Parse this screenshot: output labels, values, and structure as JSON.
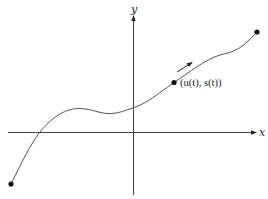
{
  "diagram": {
    "type": "parametric-curve-plot",
    "axes": {
      "x_label": "x",
      "y_label": "y"
    },
    "curve": {
      "description": "Smooth parametric curve starting bottom-left, rising through a local maximum and minimum, then increasing to top-right endpoint",
      "start_point": "endpoint-dot",
      "end_point": "endpoint-dot"
    },
    "marked_point": {
      "label": "(u(t), s(t))"
    },
    "direction_arrow": {
      "meaning": "direction of increasing t"
    },
    "colors": {
      "stroke": "#333333",
      "dot": "#111111",
      "background": "#ffffff"
    }
  }
}
